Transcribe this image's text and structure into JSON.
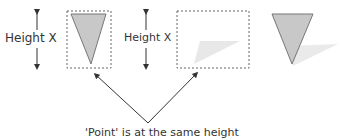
{
  "labels": {
    "height_left": "Height X",
    "height_middle": "Height X",
    "caption": "'Point' is at the same height"
  },
  "colors": {
    "triangle_fill": "#c8c8c8",
    "triangle_stroke": "#777777",
    "shadow_fill": "#e8e8e8",
    "dashed_box": "#666666",
    "arrow": "#333333",
    "text": "#333333"
  },
  "figures": [
    {
      "name": "triangle-in-box",
      "description": "Downward triangle inside dashed bounding box"
    },
    {
      "name": "shadow-in-box",
      "description": "Shadow only inside dashed bounding box"
    },
    {
      "name": "triangle-with-shadow",
      "description": "Downward triangle with drop shadow, no box"
    }
  ]
}
